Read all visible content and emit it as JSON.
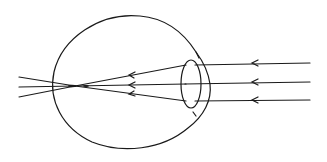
{
  "diagram": {
    "title": "Eye ray diagram: parallel light rays focusing before the retina (myopia)",
    "subject": "eye",
    "colors": {
      "line": "#1a1a1a",
      "background": "#ffffff"
    },
    "elements": {
      "eyeball": "eyeball-outline",
      "lens": "lens-ellipse",
      "rays": [
        {
          "name": "top-ray",
          "direction": "right-to-left"
        },
        {
          "name": "middle-ray",
          "direction": "right-to-left"
        },
        {
          "name": "bottom-ray",
          "direction": "right-to-left"
        }
      ],
      "focal_point": "in front of retina"
    }
  }
}
